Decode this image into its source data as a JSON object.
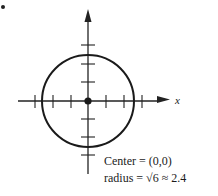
{
  "figure": {
    "marker": "•",
    "axis_x_label": "x",
    "center_text": "Center = (0,0)",
    "radius_text": "radius = √6 ≈ 2.4",
    "radius_prefix": "radius = ",
    "radius_sqrt": "√6",
    "radius_suffix": " ≈ 2.4"
  },
  "circle": {
    "center": [
      0,
      0
    ],
    "radius_exact": "√6",
    "radius_approx": 2.4,
    "stroke_color": "#1a1a1a"
  },
  "axes": {
    "x_ticks": [
      -3,
      -2,
      -1,
      1,
      2,
      3
    ],
    "y_ticks": [
      -3,
      -2,
      -1,
      1,
      2,
      3
    ]
  }
}
